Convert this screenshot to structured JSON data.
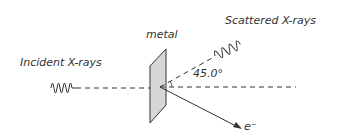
{
  "labels": {
    "metal": "metal",
    "incident": "Incident X-rays",
    "scattered": "Scattered X-rays",
    "angle": "45.0°",
    "electron": "e⁻"
  },
  "colors": {
    "line": "#333333",
    "plate_fill": "#d6d6d6"
  }
}
